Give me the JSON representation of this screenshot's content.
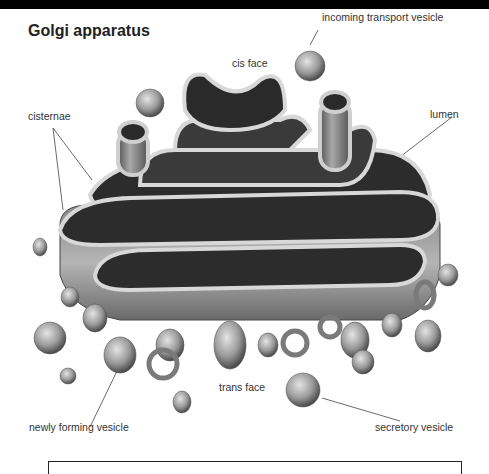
{
  "title": "Golgi apparatus",
  "labels": {
    "cis_face": "cis face",
    "incoming_transport_vesicle": "incoming transport vesicle",
    "cisternae": "cisternae",
    "lumen": "lumen",
    "trans_face": "trans face",
    "newly_forming_vesicle": "newly forming vesicle",
    "secretory_vesicle": "secretory vesicle"
  },
  "colors": {
    "background": "#ffffff",
    "topbar": "#000000",
    "organelle_light": "#d9d9d9",
    "organelle_dark": "#3a3a3a"
  }
}
